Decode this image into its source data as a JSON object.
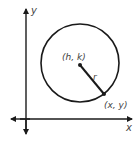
{
  "diagram": {
    "axes": {
      "x_label": "x",
      "y_label": "y"
    },
    "circle": {
      "center_label": "(h, k)",
      "radius_label": "r",
      "point_label": "(x, y)"
    },
    "colors": {
      "stroke": "#1a1a1a",
      "text": "#444444"
    }
  }
}
